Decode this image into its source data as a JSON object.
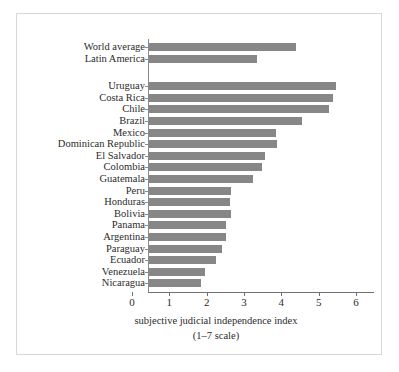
{
  "chart_data": {
    "type": "bar",
    "orientation": "horizontal",
    "title": "",
    "subtitle": "",
    "xlabel": "subjective judicial independence index",
    "xlabel_line2": "(1–7 scale)",
    "ylabel": "",
    "xlim": [
      0,
      6
    ],
    "xticks": [
      0,
      1,
      2,
      3,
      4,
      5,
      6
    ],
    "xticklabels": [
      "0",
      "1",
      "2",
      "3",
      "4",
      "5",
      "6"
    ],
    "grid": false,
    "legend": false,
    "bar_color": "#878787",
    "groups": [
      {
        "name": "benchmarks",
        "categories": [
          "World average",
          "Latin America"
        ],
        "values": [
          3.93,
          2.9
        ]
      },
      {
        "name": "countries",
        "categories": [
          "Uruguay",
          "Costa Rica",
          "Chile",
          "Brazil",
          "Mexico",
          "Dominican Republic",
          "El Salvador",
          "Colombia",
          "Guatemala",
          "Peru",
          "Honduras",
          "Bolivia",
          "Panama",
          "Argentina",
          "Paraguay",
          "Ecuador",
          "Venezuela",
          "Nicaragua"
        ],
        "values": [
          5.01,
          4.93,
          4.83,
          4.09,
          3.4,
          3.42,
          3.1,
          3.03,
          2.78,
          2.2,
          2.18,
          2.2,
          2.07,
          2.06,
          1.96,
          1.8,
          1.49,
          1.38
        ]
      }
    ],
    "categories": [
      "World average",
      "Latin America",
      "Uruguay",
      "Costa Rica",
      "Chile",
      "Brazil",
      "Mexico",
      "Dominican Republic",
      "El Salvador",
      "Colombia",
      "Guatemala",
      "Peru",
      "Honduras",
      "Bolivia",
      "Panama",
      "Argentina",
      "Paraguay",
      "Ecuador",
      "Venezuela",
      "Nicaragua"
    ],
    "values": [
      3.93,
      2.9,
      5.01,
      4.93,
      4.83,
      4.09,
      3.4,
      3.42,
      3.1,
      3.03,
      2.78,
      2.2,
      2.18,
      2.2,
      2.07,
      2.06,
      1.96,
      1.8,
      1.49,
      1.38
    ]
  },
  "figure": {
    "background": "#ffffff",
    "frame_color": "#d8d8d8",
    "axis_color": "#6f6f6f"
  }
}
